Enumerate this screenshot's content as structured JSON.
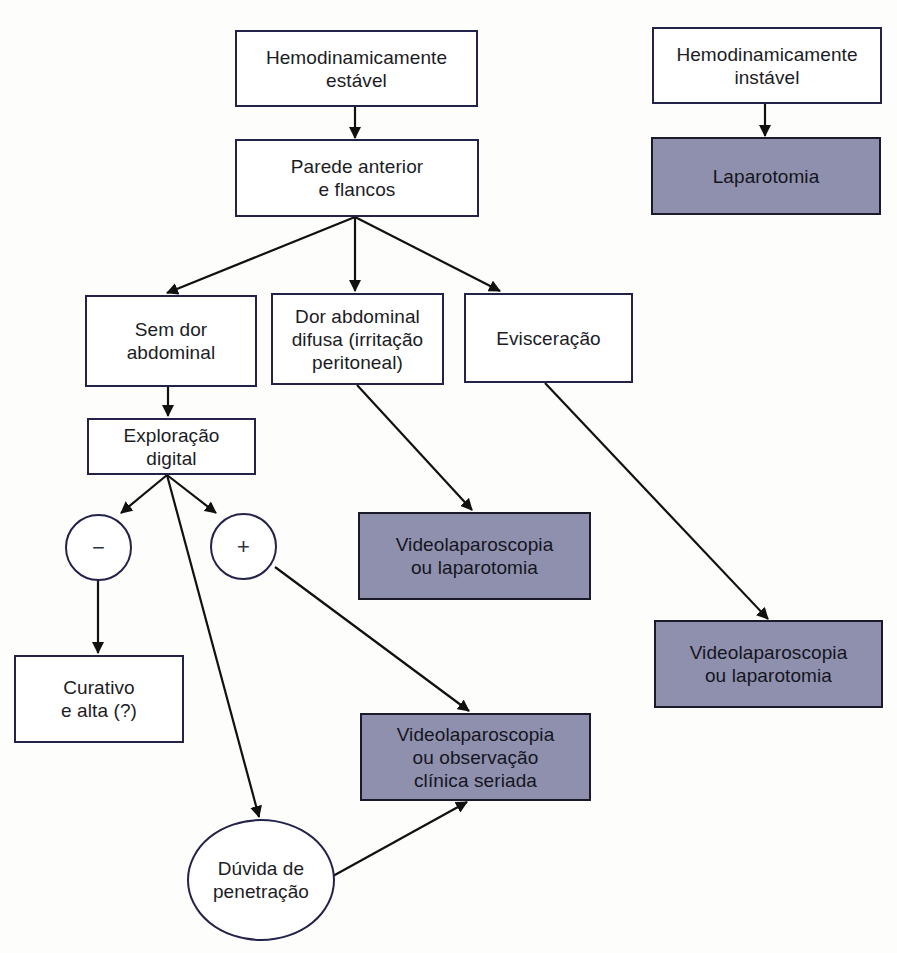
{
  "diagram": {
    "type": "flowchart",
    "colors": {
      "border": "#23234a",
      "outcome_fill": "#8e90ad",
      "node_fill": "#ffffff",
      "edge": "#111111",
      "background": "#fdfdfb"
    },
    "nodes": {
      "stable": {
        "label": "Hemodinamicamente\nestável",
        "kind": "decision"
      },
      "unstable": {
        "label": "Hemodinamicamente\ninstável",
        "kind": "decision"
      },
      "laparotomy": {
        "label": "Laparotomia",
        "kind": "outcome"
      },
      "anterior_wall": {
        "label": "Parede anterior\ne flancos",
        "kind": "decision"
      },
      "no_pain": {
        "label": "Sem dor\nabdominal",
        "kind": "decision"
      },
      "diffuse_pain": {
        "label": "Dor abdominal\ndifusa (irritação\nperitoneal)",
        "kind": "decision"
      },
      "evisceration": {
        "label": "Evisceração",
        "kind": "decision"
      },
      "digital_exploration": {
        "label": "Exploração\ndigital",
        "kind": "decision"
      },
      "negative": {
        "label": "−",
        "kind": "result"
      },
      "positive": {
        "label": "+",
        "kind": "result"
      },
      "dressing_discharge": {
        "label": "Curativo\ne alta (?)",
        "kind": "decision"
      },
      "video_or_lap_1": {
        "label": "Videolaparoscopia\nou laparotomia",
        "kind": "outcome"
      },
      "video_or_lap_2": {
        "label": "Videolaparoscopia\nou laparotomia",
        "kind": "outcome"
      },
      "video_or_observation": {
        "label": "Videolaparoscopia\nou observação\nclínica seriada",
        "kind": "outcome"
      },
      "penetration_doubt": {
        "label": "Dúvida de\npenetração",
        "kind": "result"
      }
    },
    "edges": [
      {
        "from": "stable",
        "to": "anterior_wall"
      },
      {
        "from": "unstable",
        "to": "laparotomy"
      },
      {
        "from": "anterior_wall",
        "to": "no_pain"
      },
      {
        "from": "anterior_wall",
        "to": "diffuse_pain"
      },
      {
        "from": "anterior_wall",
        "to": "evisceration"
      },
      {
        "from": "no_pain",
        "to": "digital_exploration"
      },
      {
        "from": "digital_exploration",
        "to": "negative"
      },
      {
        "from": "digital_exploration",
        "to": "positive"
      },
      {
        "from": "digital_exploration",
        "to": "penetration_doubt"
      },
      {
        "from": "negative",
        "to": "dressing_discharge"
      },
      {
        "from": "positive",
        "to": "video_or_observation"
      },
      {
        "from": "penetration_doubt",
        "to": "video_or_observation"
      },
      {
        "from": "diffuse_pain",
        "to": "video_or_lap_1"
      },
      {
        "from": "evisceration",
        "to": "video_or_lap_2"
      }
    ]
  }
}
